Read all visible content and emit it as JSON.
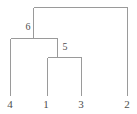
{
  "figure": {
    "type": "dendrogram",
    "title": "",
    "width": 137,
    "height": 114,
    "background_color": "#ffffff",
    "line_color": "#9a9a9a",
    "line_width": 1,
    "text_color": "#4d4d4d"
  },
  "chart_data": {
    "type": "tree",
    "orientation": "vertical-down",
    "title": "",
    "xlabel": "",
    "ylabel": "",
    "tips": [
      {
        "id": "4",
        "label": "4",
        "x": 10,
        "y_tip": 95,
        "label_x": 10,
        "label_y": 104
      },
      {
        "id": "1",
        "label": "1",
        "x": 47,
        "y_tip": 95,
        "label_x": 46,
        "label_y": 104
      },
      {
        "id": "3",
        "label": "3",
        "x": 81,
        "y_tip": 95,
        "label_x": 81,
        "label_y": 104
      },
      {
        "id": "2",
        "label": "2",
        "x": 127,
        "y_tip": 95,
        "label_x": 127,
        "label_y": 104
      }
    ],
    "internal_nodes": [
      {
        "id": "root",
        "label": "",
        "y": 7,
        "x_left": 33,
        "x_right": 127,
        "stem_x": null,
        "children": [
          "6",
          "2"
        ]
      },
      {
        "id": "6",
        "label": "6",
        "y": 38,
        "x_left": 10,
        "x_right": 57,
        "stem_x": 33,
        "label_x": 28,
        "label_y": 26,
        "children": [
          "4",
          "5"
        ]
      },
      {
        "id": "5",
        "label": "5",
        "y": 57,
        "x_left": 47,
        "x_right": 81,
        "stem_x": 57,
        "label_x": 65,
        "label_y": 46,
        "children": [
          "1",
          "3"
        ]
      }
    ],
    "edges": [
      {
        "name": "root-crossbar",
        "kind": "horizontal",
        "x1": 33,
        "x2": 127,
        "y": 7
      },
      {
        "name": "root-to-node6",
        "kind": "vertical",
        "x": 33,
        "y1": 7,
        "y2": 38
      },
      {
        "name": "root-to-tip2",
        "kind": "vertical",
        "x": 127,
        "y1": 7,
        "y2": 95
      },
      {
        "name": "node6-crossbar",
        "kind": "horizontal",
        "x1": 10,
        "x2": 57,
        "y": 38
      },
      {
        "name": "node6-to-tip4",
        "kind": "vertical",
        "x": 10,
        "y1": 38,
        "y2": 95
      },
      {
        "name": "node6-to-node5",
        "kind": "vertical",
        "x": 57,
        "y1": 38,
        "y2": 57
      },
      {
        "name": "node5-crossbar",
        "kind": "horizontal",
        "x1": 47,
        "x2": 81,
        "y": 57
      },
      {
        "name": "node5-to-tip1",
        "kind": "vertical",
        "x": 47,
        "y1": 57,
        "y2": 95
      },
      {
        "name": "node5-to-tip3",
        "kind": "vertical",
        "x": 81,
        "y1": 57,
        "y2": 95
      }
    ],
    "newick": "((4,(1,3)5)6,2);",
    "leaf_order": [
      "4",
      "1",
      "3",
      "2"
    ]
  }
}
